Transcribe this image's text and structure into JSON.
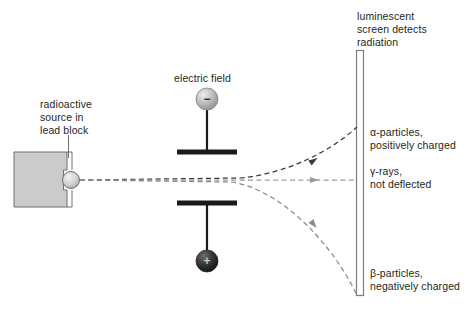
{
  "diagram": {
    "colors": {
      "text": "#231f20",
      "lead_block_fill": "#cbcbcb",
      "lead_block_stroke": "#6e6e6e",
      "plate": "#1a1a1a",
      "alpha_ray": "#3a3a3a",
      "gamma_ray": "#9b9b9b",
      "beta_ray": "#8a8a8a",
      "screen_stroke": "#7d7d7d",
      "negative_sphere": "#b9b9b9",
      "positive_sphere": "#2b2b2b"
    },
    "labels": {
      "source": "radioactive\nsource in\nlead block",
      "electric_field": "electric field",
      "screen": "luminescent\nscreen detects\nradiation",
      "alpha": "α-particles,\npositively charged",
      "gamma": "γ-rays,\nnot deflected",
      "beta": "β-particles,\nnegatively charged"
    },
    "terminals": {
      "negative_sign": "−",
      "positive_sign": "+"
    },
    "rays": [
      {
        "name": "alpha",
        "deflection": "upward",
        "charge": "positive"
      },
      {
        "name": "gamma",
        "deflection": "none",
        "charge": "neutral"
      },
      {
        "name": "beta",
        "deflection": "downward",
        "charge": "negative"
      }
    ]
  }
}
